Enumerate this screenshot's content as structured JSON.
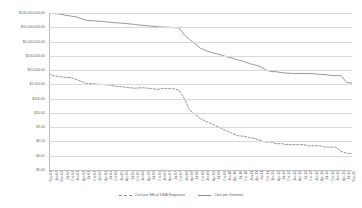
{
  "chart_data": {
    "type": "line",
    "title": "",
    "xlabel": "",
    "ylabel": "",
    "yscale": "log",
    "ylim": [
      1,
      100000000
    ],
    "grid": true,
    "legend_position": "bottom",
    "ytick_labels": [
      "$100,000,000.00",
      "$10,000,000.00",
      "$1,000,000.00",
      "$100,000.00",
      "$10,000.00",
      "$1,000.00",
      "$100.00",
      "$10.00",
      "$1.00",
      "$0.10",
      "$0.01",
      "$0.00"
    ],
    "ytick_values": [
      100000000,
      10000000,
      1000000,
      100000,
      10000,
      1000,
      100,
      10,
      1,
      0.1,
      0.01,
      0.001
    ],
    "categories": [
      "Sep-01",
      "Jan-02",
      "Mar-02",
      "Jul-02",
      "Oct-02",
      "Jan-03",
      "Apr-03",
      "Jul-03",
      "Oct-03",
      "Jan-04",
      "Apr-04",
      "Jul-04",
      "Oct-04",
      "Jan-05",
      "Apr-05",
      "Jul-05",
      "Oct-05",
      "Jan-06",
      "Apr-06",
      "Jul-06",
      "Oct-06",
      "Jan-07",
      "Apr-07",
      "Jul-07",
      "Oct-07",
      "Jan-08",
      "Apr-08",
      "Jul-08",
      "Oct-08",
      "Jan-09",
      "Apr-09",
      "Jul-09",
      "Oct-09",
      "Jan-10",
      "Apr-10",
      "Jul-10",
      "Oct-10",
      "Jan-11",
      "Apr-11",
      "Jul-11",
      "Oct-11",
      "Jan-12",
      "Apr-12",
      "Jul-12",
      "Oct-12",
      "Jan-13",
      "Apr-13",
      "Jul-13",
      "Oct-13",
      "Jan-14",
      "Apr-14",
      "Jul-14",
      "Oct-14",
      "Jan-15",
      "Apr-15",
      "Jul-15",
      "Sep-15"
    ],
    "series": [
      {
        "name": "Cost per Mb of DNA Sequence",
        "style": "dashed",
        "color": "#8c8c8c",
        "values": [
          5292.39,
          3898.64,
          3413.8,
          3102.23,
          2986.2,
          2230.98,
          1598.91,
          1135.7,
          1107.46,
          1028.3,
          974.16,
          897.76,
          779.53,
          699.2,
          635.57,
          573.67,
          536.86,
          581.92,
          552.39,
          502.61,
          440.18,
          522.71,
          495.96,
          495.96,
          397.09,
          102.13,
          15.03,
          8.0,
          3.81,
          2.59,
          1.72,
          1.2,
          0.78,
          0.52,
          0.35,
          0.25,
          0.23,
          0.19,
          0.16,
          0.12,
          0.09,
          0.09,
          0.07,
          0.07,
          0.06,
          0.06,
          0.06,
          0.06,
          0.05,
          0.05,
          0.05,
          0.04,
          0.04,
          0.04,
          0.02,
          0.015,
          0.014
        ]
      },
      {
        "name": "Cost per Genome",
        "style": "solid",
        "color": "#8c8c8c",
        "values": [
          95263072,
          90600000,
          83700000,
          70200000,
          61400000,
          53751684,
          40157554,
          30000000,
          28800000,
          27000000,
          25000000,
          23000000,
          21000000,
          20000000,
          18500000,
          17000000,
          15500000,
          14000000,
          13000000,
          12000000,
          11000000,
          10474556,
          10000000,
          9500000,
          9000000,
          3063820,
          1352982,
          700000,
          340000,
          232735,
          170000,
          140000,
          108065,
          82000,
          68000,
          50000,
          41000,
          29092,
          23000,
          18000,
          10497,
          7950,
          7700,
          6600,
          6100,
          5826,
          5800,
          5750,
          5700,
          5550,
          4920,
          4905,
          4200,
          4000,
          4100,
          1380,
          1245
        ]
      }
    ]
  },
  "legend": {
    "items": [
      {
        "label": "Cost per Mb of DNA Sequence",
        "style": "dashed"
      },
      {
        "label": "Cost per Genome",
        "style": "solid"
      }
    ]
  }
}
